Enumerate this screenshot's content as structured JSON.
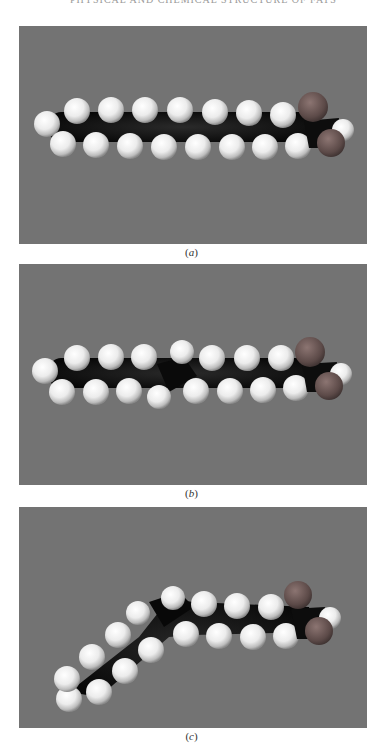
{
  "page": {
    "running_head": "PHYSICAL AND CHEMICAL STRUCTURE OF FATS"
  },
  "figures": [
    {
      "id": "a",
      "caption_open": "(",
      "caption_letter": "a",
      "caption_close": ")",
      "depicts": "space-filling model of straight saturated fatty acid chain",
      "background_color": "#737373"
    },
    {
      "id": "b",
      "caption_open": "(",
      "caption_letter": "b",
      "caption_close": ")",
      "depicts": "space-filling model of straight-chain fatty acid with trans double bond",
      "background_color": "#737373"
    },
    {
      "id": "c",
      "caption_open": "(",
      "caption_letter": "c",
      "caption_close": ")",
      "depicts": "space-filling model of bent fatty acid chain with cis double bond",
      "background_color": "#737373"
    }
  ],
  "colors": {
    "hydrogen": "#f2f2f2",
    "carbon": "#151515",
    "oxygen": "#6e5a58",
    "background": "#737373"
  }
}
